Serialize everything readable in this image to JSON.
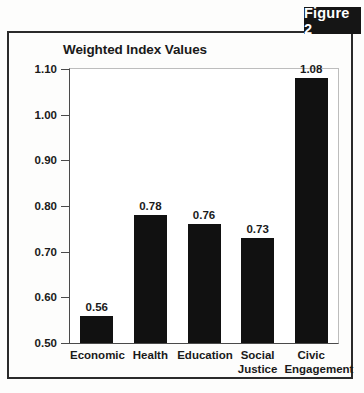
{
  "figure": {
    "badge_label": "Figure 2"
  },
  "chart_data": {
    "type": "bar",
    "title": "Weighted Index Values",
    "xlabel": "",
    "ylabel": "",
    "ylim": [
      0.5,
      1.1
    ],
    "ytick_step": 0.1,
    "grid": false,
    "legend": "none",
    "bar_color": "#111111",
    "categories": [
      "Economic",
      "Health",
      "Education",
      "Social Justice",
      "Civic Engagement"
    ],
    "category_lines": [
      [
        "Economic"
      ],
      [
        "Health"
      ],
      [
        "Education"
      ],
      [
        "Social",
        "Justice"
      ],
      [
        "Civic",
        "Engagement"
      ]
    ],
    "values": [
      0.56,
      0.78,
      0.76,
      0.73,
      1.08
    ],
    "value_labels": [
      "0.56",
      "0.78",
      "0.76",
      "0.73",
      "1.08"
    ],
    "ytick_labels": [
      "1.10",
      "1.00",
      "0.90",
      "0.80",
      "0.70",
      "0.60",
      "0.50"
    ],
    "ytick_values": [
      1.1,
      1.0,
      0.9,
      0.8,
      0.7,
      0.6,
      0.5
    ]
  }
}
